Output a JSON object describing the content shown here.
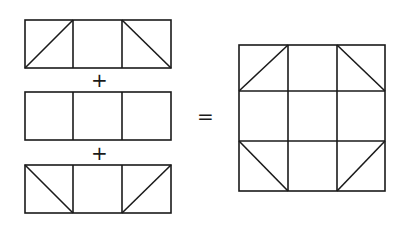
{
  "diagram": {
    "operators": {
      "plus": "+",
      "equals": "="
    },
    "strips": [
      {
        "name": "top-strip",
        "cells": [
          "diag-bl-tr",
          "plain",
          "diag-tl-br"
        ]
      },
      {
        "name": "middle-strip",
        "cells": [
          "plain",
          "plain",
          "plain"
        ]
      },
      {
        "name": "bottom-strip",
        "cells": [
          "diag-tl-br",
          "plain",
          "diag-bl-tr"
        ]
      }
    ],
    "result": {
      "name": "assembled-block",
      "rows": 3,
      "cols": 3
    },
    "line_color": "#1a1a1a"
  }
}
